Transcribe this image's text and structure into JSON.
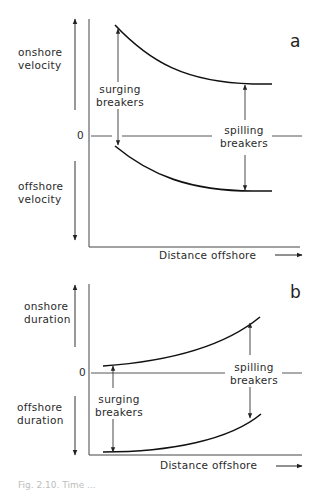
{
  "panels": [
    {
      "id": "a",
      "label": "a",
      "y_upper_label": [
        "onshore",
        "velocity"
      ],
      "y_lower_label": [
        "offshore",
        "velocity"
      ],
      "zero_label": "0",
      "x_label": "Distance offshore",
      "surging_label": [
        "surging",
        "breakers"
      ],
      "spilling_label": [
        "spilling",
        "breakers"
      ]
    },
    {
      "id": "b",
      "label": "b",
      "y_upper_label": [
        "onshore",
        "duration"
      ],
      "y_lower_label": [
        "offshore",
        "duration"
      ],
      "zero_label": "0",
      "x_label": "Distance offshore",
      "surging_label": [
        "surging",
        "breakers"
      ],
      "spilling_label": [
        "spilling",
        "breakers"
      ]
    }
  ],
  "caption": "Fig. 2.10. Time ..."
}
